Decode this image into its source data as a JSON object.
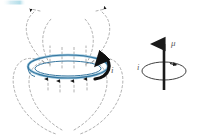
{
  "figure": {
    "background_color": "#ffffff",
    "width": 198,
    "height": 140,
    "colors": {
      "loop_blue": "#3f7fa8",
      "loop_blue_light": "#8fc0d8",
      "field_line_gray": "#9a9a9a",
      "arrow_black": "#1a1a1a",
      "label_gray": "#5a5a5a",
      "corner_strip_cyan": "#bfe3ec"
    }
  },
  "left_panel": {
    "name": "current-loop-with-field-lines",
    "current_loop": {
      "label": "i",
      "description": "blue elliptical current-carrying ring drawn as a double line",
      "center_x": 68,
      "center_y": 68,
      "radius_x": 40,
      "radius_y": 11
    },
    "current_direction_arrow": {
      "label": "i",
      "description": "thick black curved arrow on right side of loop showing current circulation"
    },
    "field_lines": {
      "style": "dashed",
      "count": 2,
      "description": "closed dipole field loops on each side of the current loop"
    },
    "field_arrows": {
      "top_count": 2,
      "top_direction": "outward",
      "axis_up_count": 4,
      "below_loop_count": 4,
      "below_loop_direction": "up"
    },
    "axis_dashes": {
      "count": 4,
      "description": "vertical dashed segments through the loop interior pointing up"
    }
  },
  "right_panel": {
    "name": "magnetic-moment-vector",
    "moment_vector": {
      "label": "μ",
      "description": "vertical black arrow pointing up representing magnetic moment"
    },
    "current_circle": {
      "label": "i",
      "description": "ellipse around the vector with a small arrowhead indicating current sense"
    }
  },
  "corner_artifact": {
    "name": "scan-edge-strip",
    "description": "faint cyan gradient strip at top-left edge of the scan"
  },
  "labels": {
    "mu": "μ",
    "i_loop": "i",
    "i_moment": "i"
  }
}
